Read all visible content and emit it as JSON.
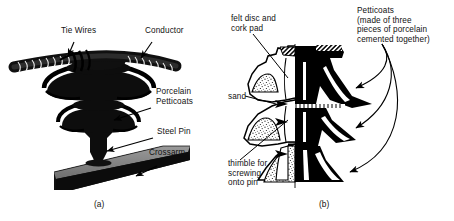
{
  "figure": {
    "background_color": "#ffffff",
    "ink_color": "#000000",
    "panels": [
      {
        "id": "a",
        "caption": "(a)",
        "description": "pin-type porcelain insulator mounted on crossarm with conductor and tie wires",
        "labels": [
          {
            "name": "tie-wires",
            "text": "Tie Wires"
          },
          {
            "name": "conductor",
            "text": "Conductor"
          },
          {
            "name": "porcelain-petticoats",
            "text": "Porcelain\nPetticoats"
          },
          {
            "name": "steel-pin",
            "text": "Steel Pin"
          },
          {
            "name": "crossarm",
            "text": "Crossarm"
          }
        ]
      },
      {
        "id": "b",
        "caption": "(b)",
        "description": "half cross-section of the insulator showing internal construction",
        "labels": [
          {
            "name": "felt-disc-and-cork-pad",
            "text": "felt disc and\ncork pad"
          },
          {
            "name": "sand",
            "text": "sand"
          },
          {
            "name": "thimble",
            "text": "thimble for\nscrewing\nonto pin"
          },
          {
            "name": "petticoats-note",
            "text": "Petticoats\n(made of three\npieces of porcelain\ncemented together)"
          }
        ]
      }
    ]
  }
}
